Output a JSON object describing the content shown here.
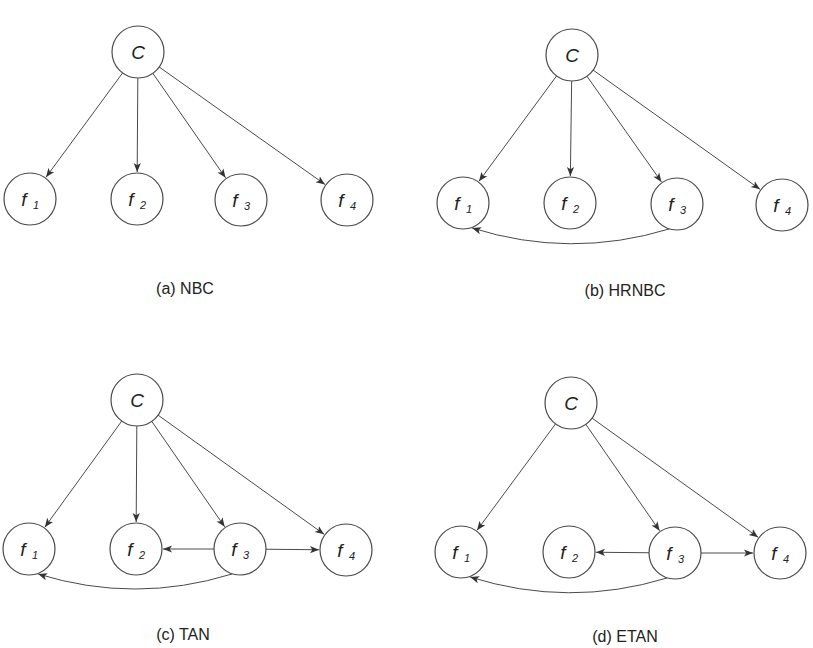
{
  "figure": {
    "colors": {
      "stroke": "#4a4a4a",
      "text": "#222222",
      "background": "#ffffff"
    },
    "node_radius": 26,
    "panels": [
      {
        "id": "a",
        "caption": "(a) NBC",
        "caption_pos": [
          185,
          294
        ],
        "nodes": [
          {
            "id": "C",
            "main": "C",
            "sub": "",
            "x": 138,
            "y": 52
          },
          {
            "id": "f1",
            "main": "f",
            "sub": "1",
            "x": 30,
            "y": 199
          },
          {
            "id": "f2",
            "main": "f",
            "sub": "2",
            "x": 137,
            "y": 199
          },
          {
            "id": "f3",
            "main": "f",
            "sub": "3",
            "x": 241,
            "y": 200
          },
          {
            "id": "f4",
            "main": "f",
            "sub": "4",
            "x": 347,
            "y": 200
          }
        ],
        "edges": [
          {
            "from": "C",
            "to": "f1"
          },
          {
            "from": "C",
            "to": "f2"
          },
          {
            "from": "C",
            "to": "f3"
          },
          {
            "from": "C",
            "to": "f4"
          }
        ]
      },
      {
        "id": "b",
        "caption": "(b) HRNBC",
        "caption_pos": [
          625,
          296
        ],
        "nodes": [
          {
            "id": "C",
            "main": "C",
            "sub": "",
            "x": 572,
            "y": 55
          },
          {
            "id": "f1",
            "main": "f",
            "sub": "1",
            "x": 463,
            "y": 203
          },
          {
            "id": "f2",
            "main": "f",
            "sub": "2",
            "x": 570,
            "y": 203
          },
          {
            "id": "f3",
            "main": "f",
            "sub": "3",
            "x": 677,
            "y": 204
          },
          {
            "id": "f4",
            "main": "f",
            "sub": "4",
            "x": 782,
            "y": 205
          }
        ],
        "edges": [
          {
            "from": "C",
            "to": "f1"
          },
          {
            "from": "C",
            "to": "f2"
          },
          {
            "from": "C",
            "to": "f3"
          },
          {
            "from": "C",
            "to": "f4"
          },
          {
            "from": "f3",
            "to": "f1",
            "curved": true
          }
        ]
      },
      {
        "id": "c",
        "caption": "(c) TAN",
        "caption_pos": [
          183,
          640
        ],
        "nodes": [
          {
            "id": "C",
            "main": "C",
            "sub": "",
            "x": 137,
            "y": 400
          },
          {
            "id": "f1",
            "main": "f",
            "sub": "1",
            "x": 29,
            "y": 549
          },
          {
            "id": "f2",
            "main": "f",
            "sub": "2",
            "x": 136,
            "y": 549
          },
          {
            "id": "f3",
            "main": "f",
            "sub": "3",
            "x": 240,
            "y": 549
          },
          {
            "id": "f4",
            "main": "f",
            "sub": "4",
            "x": 346,
            "y": 550
          }
        ],
        "edges": [
          {
            "from": "C",
            "to": "f1"
          },
          {
            "from": "C",
            "to": "f2"
          },
          {
            "from": "C",
            "to": "f3"
          },
          {
            "from": "C",
            "to": "f4"
          },
          {
            "from": "f3",
            "to": "f2"
          },
          {
            "from": "f3",
            "to": "f4"
          },
          {
            "from": "f3",
            "to": "f1",
            "curved": true
          }
        ]
      },
      {
        "id": "d",
        "caption": "(d) ETAN",
        "caption_pos": [
          625,
          642
        ],
        "nodes": [
          {
            "id": "C",
            "main": "C",
            "sub": "",
            "x": 571,
            "y": 403
          },
          {
            "id": "f1",
            "main": "f",
            "sub": "1",
            "x": 461,
            "y": 552
          },
          {
            "id": "f2",
            "main": "f",
            "sub": "2",
            "x": 569,
            "y": 552
          },
          {
            "id": "f3",
            "main": "f",
            "sub": "3",
            "x": 675,
            "y": 553
          },
          {
            "id": "f4",
            "main": "f",
            "sub": "4",
            "x": 780,
            "y": 553
          }
        ],
        "edges": [
          {
            "from": "C",
            "to": "f1"
          },
          {
            "from": "C",
            "to": "f3"
          },
          {
            "from": "C",
            "to": "f4"
          },
          {
            "from": "f3",
            "to": "f2"
          },
          {
            "from": "f3",
            "to": "f4"
          },
          {
            "from": "f3",
            "to": "f1",
            "curved": true
          }
        ]
      }
    ]
  }
}
